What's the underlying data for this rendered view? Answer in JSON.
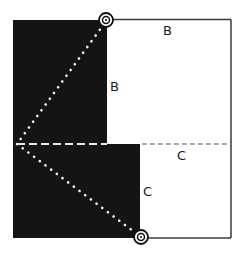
{
  "diagram": {
    "type": "geometric-fold-diagram",
    "colors": {
      "background": "#ffffff",
      "dark_region": "#141414",
      "outline": "#3a3a3a",
      "dotted_line": "#f2f2f2",
      "dashed_line_on_dark": "#e8e8e8",
      "dashed_line_on_light": "#555555",
      "marker": "#111111"
    },
    "labels": {
      "top_edge": "B",
      "upper_vertical_edge": "B",
      "dashed_right": "C",
      "lower_vertical_edge": "C"
    },
    "markers": [
      {
        "name": "top-target-marker",
        "x": 106,
        "y": 20
      },
      {
        "name": "bottom-target-marker",
        "x": 141,
        "y": 237
      }
    ],
    "lines": {
      "dotted_upper": {
        "from": [
          106,
          20
        ],
        "to": [
          17,
          144
        ]
      },
      "dotted_lower": {
        "from": [
          17,
          144
        ],
        "to": [
          141,
          237
        ]
      },
      "dashed_horizontal_y": 144
    }
  }
}
